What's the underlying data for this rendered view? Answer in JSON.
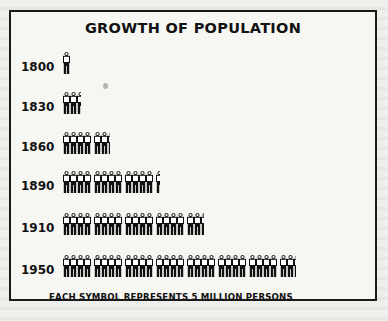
{
  "chart_data": {
    "type": "pictograph",
    "title": "GROWTH OF POPULATION",
    "xlabel": "",
    "ylabel": "",
    "unit_note": "EACH SYMBOL REPRESENTS 5 MILLION PERSONS",
    "symbol_value_millions": 5,
    "categories": [
      "1800",
      "1830",
      "1860",
      "1890",
      "1910",
      "1950"
    ],
    "symbol_counts": [
      1.0,
      2.6,
      6.3,
      12.6,
      18.4,
      30.3
    ],
    "values_millions": [
      5,
      13,
      31.5,
      63,
      92,
      151.5
    ],
    "group_size": 4,
    "legend": [],
    "grid": false
  },
  "figure": {
    "title": "GROWTH OF POPULATION",
    "footnote": "EACH SYMBOL REPRESENTS 5 MILLION PERSONS",
    "rows": [
      {
        "year": "1800",
        "symbols": 1.0
      },
      {
        "year": "1830",
        "symbols": 2.6
      },
      {
        "year": "1860",
        "symbols": 6.3
      },
      {
        "year": "1890",
        "symbols": 12.6
      },
      {
        "year": "1910",
        "symbols": 18.4
      },
      {
        "year": "1950",
        "symbols": 30.3
      }
    ]
  },
  "colors": {
    "ink": "#111111",
    "paper": "#f6f6f3",
    "border": "#1a1a1a"
  },
  "icons": {
    "symbol": "person-icon"
  }
}
